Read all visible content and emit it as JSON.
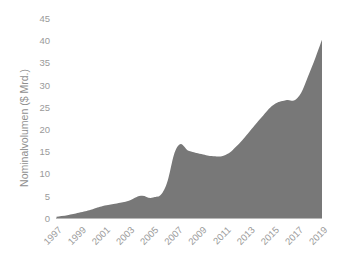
{
  "chart_data": {
    "type": "area",
    "title": "",
    "subtitle": "",
    "xlabel": "",
    "ylabel": "Nominalvolumen ($ Mrd.)",
    "ylim": [
      0,
      45
    ],
    "xlim": [
      1997,
      2019
    ],
    "grid": false,
    "legend": "none",
    "series_color": "#787878",
    "axis_color": "#9a9a9a",
    "background_color": "#ffffff",
    "y_ticks": [
      0,
      5,
      10,
      15,
      20,
      25,
      30,
      35,
      40,
      45
    ],
    "y_tick_labels": [
      "0",
      "5",
      "10",
      "15",
      "20",
      "25",
      "30",
      "35",
      "40",
      "45"
    ],
    "x_ticks": [
      1997,
      1999,
      2001,
      2003,
      2005,
      2007,
      2009,
      2011,
      2013,
      2015,
      2017,
      2019
    ],
    "x_tick_labels": [
      "1997",
      "1999",
      "2001",
      "2003",
      "2005",
      "2007",
      "2009",
      "2011",
      "2013",
      "2015",
      "2017",
      "2019"
    ],
    "x_tick_rotation": 45,
    "x": [
      1997,
      1998,
      1999,
      2000,
      2001,
      2002,
      2003,
      2004,
      2005,
      2006,
      2007,
      2008,
      2009,
      2010,
      2011,
      2012,
      2013,
      2014,
      2015,
      2016,
      2017,
      2018,
      2019
    ],
    "categories": [
      "1997",
      "1998",
      "1999",
      "2000",
      "2001",
      "2002",
      "2003",
      "2004",
      "2005",
      "2006",
      "2007",
      "2008",
      "2009",
      "2010",
      "2011",
      "2012",
      "2013",
      "2014",
      "2015",
      "2016",
      "2017",
      "2018",
      "2019"
    ],
    "values": [
      0.4,
      0.8,
      1.4,
      2.1,
      2.9,
      3.4,
      4.0,
      5.1,
      4.7,
      6.9,
      16.1,
      15.2,
      14.5,
      14.0,
      14.3,
      16.5,
      19.6,
      22.8,
      25.6,
      26.6,
      27.2,
      33.0,
      40.2
    ],
    "series": [
      {
        "name": "Nominalvolumen",
        "color": "#787878",
        "values": [
          0.4,
          0.8,
          1.4,
          2.1,
          2.9,
          3.4,
          4.0,
          5.1,
          4.7,
          6.9,
          16.1,
          15.2,
          14.5,
          14.0,
          14.3,
          16.5,
          19.6,
          22.8,
          25.6,
          26.6,
          27.2,
          33.0,
          40.2
        ]
      }
    ],
    "annotations": []
  },
  "axes": {
    "y_axis_title": "Nominalvolumen ($ Mrd.)"
  }
}
